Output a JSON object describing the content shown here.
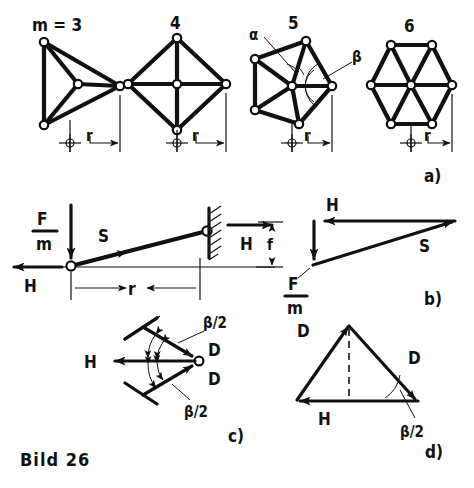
{
  "figure": {
    "caption": "Bild 26",
    "panel_labels": {
      "a": "a)",
      "b": "b)",
      "c": "c)",
      "d": "d)"
    }
  },
  "panel_a": {
    "name": "polygon-spoke-wheels-row",
    "dimension_label": "r",
    "polygons": [
      {
        "id": "m3",
        "title": "m = 3",
        "sides": 3
      },
      {
        "id": "m4",
        "title": "4",
        "sides": 4
      },
      {
        "id": "m5",
        "title": "5",
        "sides": 5,
        "angle_labels": {
          "alpha": "α",
          "beta": "β"
        }
      },
      {
        "id": "m6",
        "title": "6",
        "sides": 6
      }
    ]
  },
  "panel_b": {
    "beam": {
      "name": "cantilever-beam-free-body",
      "load_numerator": "F",
      "load_denominator": "m",
      "axial_force": "S",
      "reaction_left": "H",
      "reaction_right": "H",
      "radius_dim": "r",
      "sag_dim": "f"
    },
    "force_triangle": {
      "name": "force-triangle",
      "horizontal": "H",
      "diagonal": "S",
      "vertical_numerator": "F",
      "vertical_denominator": "m"
    }
  },
  "panel_c": {
    "name": "hub-force-balance",
    "resultant": "H",
    "spoke_force_upper": "D",
    "spoke_force_lower": "D",
    "half_angle_upper": "β/2",
    "half_angle_lower": "β/2"
  },
  "panel_d": {
    "name": "closed-force-triangle",
    "left_force": "D",
    "right_force": "D",
    "base_force": "H",
    "half_angle": "β/2"
  },
  "colors": {
    "ink": "#111111",
    "paper": "#ffffff"
  }
}
